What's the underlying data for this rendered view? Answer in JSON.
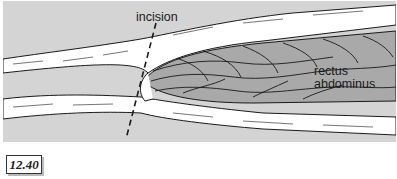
{
  "figure": {
    "number": "12.40",
    "labels": {
      "incision": "incision",
      "rectus_line1": "rectus",
      "rectus_line2": "abdominus"
    },
    "colors": {
      "background": "#d4d4d4",
      "muscle": "#a9a9a9",
      "sheath": "#ffffff",
      "outline": "#1a1a1a"
    }
  }
}
